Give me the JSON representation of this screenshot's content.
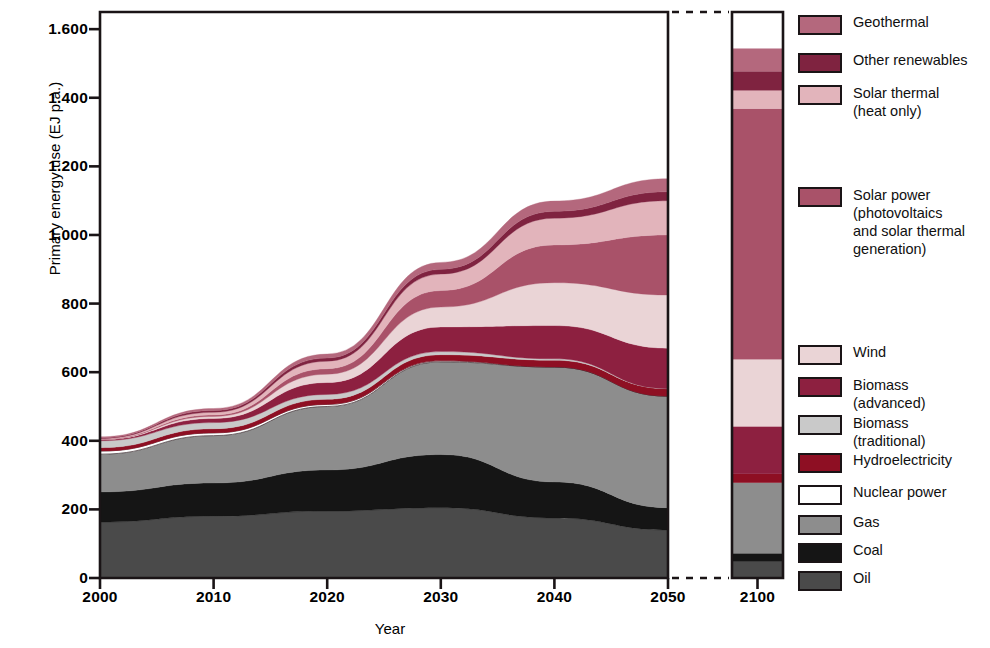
{
  "chart_data": {
    "type": "area",
    "title": "",
    "xlabel": "Year",
    "ylabel": "Primary energy use (EJ p.a.)",
    "ylim": [
      0,
      1650
    ],
    "yticks": [
      0,
      200,
      400,
      600,
      800,
      1000,
      1200,
      1400,
      1600
    ],
    "ytick_labels": [
      "0",
      "200",
      "400",
      "600",
      "800",
      "1.000",
      "1.200",
      "1.400",
      "1.600"
    ],
    "grid": false,
    "legend_position": "right",
    "decimal_separator": "period-as-thousands",
    "x": [
      2000,
      2010,
      2020,
      2030,
      2040,
      2050
    ],
    "x_tick_labels": [
      "2000",
      "2010",
      "2020",
      "2030",
      "2040",
      "2050"
    ],
    "axis_break": true,
    "separate_panel": {
      "x": 2100,
      "x_tick_label": "2100",
      "total": 1590
    },
    "stack_order_bottom_to_top": [
      "Oil",
      "Coal",
      "Gas",
      "Nuclear power",
      "Hydroelectricity",
      "Biomass (traditional)",
      "Biomass (advanced)",
      "Wind",
      "Solar power (photovoltaics and solar thermal generation)",
      "Solar thermal (heat only)",
      "Other renewables",
      "Geothermal"
    ],
    "series": [
      {
        "name": "Oil",
        "color": "#4a4a4a",
        "values": [
          163,
          180,
          195,
          205,
          175,
          140
        ],
        "value_2100": 48
      },
      {
        "name": "Coal",
        "color": "#151515",
        "values": [
          88,
          97,
          120,
          155,
          105,
          65
        ],
        "value_2100": 24
      },
      {
        "name": "Gas",
        "color": "#8d8d8d",
        "values": [
          110,
          138,
          185,
          270,
          335,
          325
        ],
        "value_2100": 206
      },
      {
        "name": "Nuclear power",
        "color": "#ffffff",
        "values": [
          9,
          8,
          6,
          3,
          0,
          0
        ],
        "value_2100": 0
      },
      {
        "name": "Hydroelectricity",
        "color": "#8e0f23",
        "values": [
          10,
          12,
          15,
          18,
          20,
          22
        ],
        "value_2100": 26
      },
      {
        "name": "Biomass (traditional)",
        "color": "#c9c9c9",
        "values": [
          20,
          18,
          14,
          9,
          4,
          0
        ],
        "value_2100": 0
      },
      {
        "name": "Biomass (advanced)",
        "color": "#8d2040",
        "values": [
          3,
          12,
          35,
          72,
          97,
          118
        ],
        "value_2100": 138
      },
      {
        "name": "Wind",
        "color": "#ead4d6",
        "values": [
          1,
          6,
          24,
          58,
          125,
          155
        ],
        "value_2100": 196
      },
      {
        "name": "Solar power (photovoltaics and solar thermal generation)",
        "color": "#a95269",
        "values": [
          0.5,
          4,
          16,
          48,
          110,
          175
        ],
        "value_2100": 730
      },
      {
        "name": "Solar thermal (heat only)",
        "color": "#e2b4bb",
        "values": [
          2,
          8,
          22,
          48,
          78,
          100
        ],
        "value_2100": 54
      },
      {
        "name": "Other renewables",
        "color": "#7f2340",
        "values": [
          2,
          5,
          9,
          14,
          20,
          26
        ],
        "value_2100": 55
      },
      {
        "name": "Geothermal",
        "color": "#b4687d",
        "values": [
          3,
          6,
          12,
          20,
          30,
          38
        ],
        "value_2100": 66
      }
    ],
    "totals": [
      411,
      494,
      653,
      880,
      1099,
      1164
    ],
    "annotations": []
  },
  "axes": {
    "ylabel": "Primary energy use (EJ p.a.)",
    "xlabel": "Year",
    "ytick_labels": [
      "0",
      "200",
      "400",
      "600",
      "800",
      "1.000",
      "1.200",
      "1.400",
      "1.600"
    ],
    "xtick_labels": [
      "2000",
      "2010",
      "2020",
      "2030",
      "2040",
      "2050"
    ],
    "inset_xtick_label": "2100"
  },
  "legend": {
    "items": [
      {
        "label": "Geothermal",
        "color": "#b4687d"
      },
      {
        "label": "Other renewables",
        "color": "#7f2340"
      },
      {
        "label": "Solar thermal\n(heat only)",
        "color": "#e2b4bb"
      },
      {
        "label": "Solar power\n(photovoltaics\nand solar thermal\ngeneration)",
        "color": "#a95269"
      },
      {
        "label": "Wind",
        "color": "#ead4d6"
      },
      {
        "label": "Biomass\n(advanced)",
        "color": "#8d2040"
      },
      {
        "label": "Biomass\n(traditional)",
        "color": "#c9c9c9"
      },
      {
        "label": "Hydroelectricity",
        "color": "#8e0f23"
      },
      {
        "label": "Nuclear power",
        "color": "#ffffff"
      },
      {
        "label": "Gas",
        "color": "#8d8d8d"
      },
      {
        "label": "Coal",
        "color": "#151515"
      },
      {
        "label": "Oil",
        "color": "#4a4a4a"
      }
    ]
  }
}
